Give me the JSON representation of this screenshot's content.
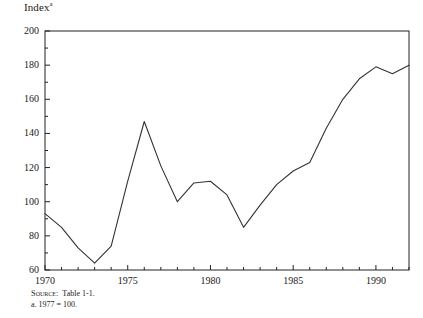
{
  "figure": {
    "title": "Index",
    "title_superscript": "a",
    "source_prefix": "Source:",
    "source_text": "Table 1-1.",
    "footnote": "a. 1977 = 100.",
    "line_color": "#333333",
    "frame_color": "#222222",
    "background": "#ffffff"
  },
  "chart_data": {
    "type": "line",
    "title": "Index",
    "xlabel": "",
    "ylabel": "Index",
    "xlim": [
      1970,
      1992
    ],
    "ylim": [
      60,
      200
    ],
    "ytick_interval": 20,
    "yticks": [
      60,
      80,
      100,
      120,
      140,
      160,
      180,
      200
    ],
    "ytick_labels": [
      "60",
      "80",
      "100",
      "120",
      "140",
      "160",
      "180",
      "200"
    ],
    "yminor_interval": 10,
    "xticks": [
      1970,
      1975,
      1980,
      1985,
      1990
    ],
    "xtick_labels": [
      "1970",
      "1975",
      "1980",
      "1985",
      "1990"
    ],
    "xminor_interval": 1,
    "grid": false,
    "legend": "none",
    "x": [
      1970,
      1971,
      1972,
      1973,
      1974,
      1975,
      1976,
      1977,
      1978,
      1979,
      1980,
      1981,
      1982,
      1983,
      1984,
      1985,
      1986,
      1987,
      1988,
      1989,
      1990,
      1991,
      1992
    ],
    "values": [
      93,
      85,
      73,
      64,
      74,
      112,
      147,
      121,
      100,
      111,
      112,
      104,
      85,
      98,
      110,
      118,
      123,
      143,
      160,
      172,
      179,
      175,
      180
    ],
    "series": [
      {
        "name": "Index",
        "values": [
          93,
          85,
          73,
          64,
          74,
          112,
          147,
          121,
          100,
          111,
          112,
          104,
          85,
          98,
          110,
          118,
          123,
          143,
          160,
          172,
          179,
          175,
          180
        ]
      }
    ],
    "annotations": []
  }
}
